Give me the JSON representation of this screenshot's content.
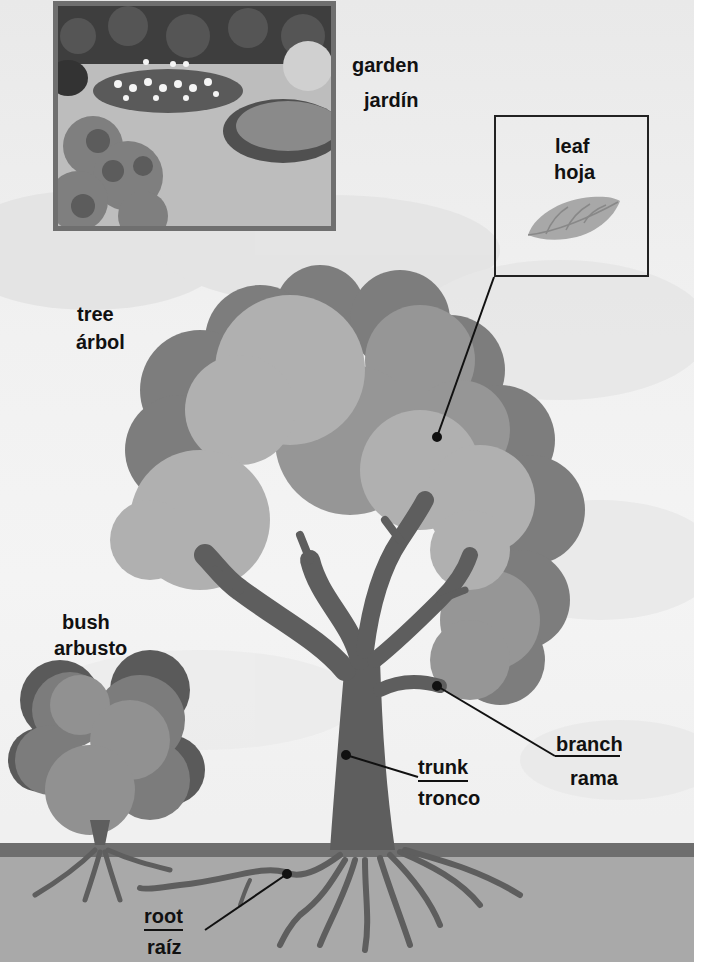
{
  "labels": {
    "garden": {
      "en": "garden",
      "es": "jardín"
    },
    "leaf": {
      "en": "leaf",
      "es": "hoja"
    },
    "tree": {
      "en": "tree",
      "es": "árbol"
    },
    "bush": {
      "en": "bush",
      "es": "arbusto"
    },
    "branch": {
      "en": "branch",
      "es": "rama"
    },
    "trunk": {
      "en": "trunk",
      "es": "tronco"
    },
    "root": {
      "en": "root",
      "es": "raíz"
    }
  },
  "colors": {
    "sky": "#efefef",
    "foliage_dark": "#7d7d7d",
    "foliage_mid": "#969696",
    "foliage_light": "#b0b0b0",
    "trunk": "#5e5e5e",
    "ground_stripe": "#6e6e6e",
    "ground": "#a9a9a9",
    "text": "#111111",
    "leader_line": "#111111"
  },
  "images": {
    "garden_photo": "garden-illustration",
    "leaf_icon": "leaf-illustration"
  }
}
